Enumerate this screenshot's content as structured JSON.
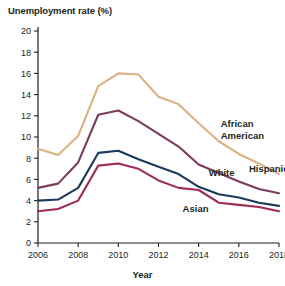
{
  "chart_data": {
    "type": "line",
    "title": "Unemployment rate (%)",
    "xlabel": "Year",
    "ylabel": "Unemployment rate (%)",
    "xlim": [
      2006,
      2018
    ],
    "ylim": [
      0,
      20
    ],
    "xticks": [
      2006,
      2008,
      2010,
      2012,
      2014,
      2016,
      2018
    ],
    "yticks": [
      0,
      2,
      4,
      6,
      8,
      10,
      12,
      14,
      16,
      18,
      20
    ],
    "grid": false,
    "legend_position": "inline-right",
    "x": [
      2006,
      2007,
      2008,
      2009,
      2010,
      2011,
      2012,
      2013,
      2014,
      2015,
      2016,
      2017,
      2018
    ],
    "series": [
      {
        "name": "African American",
        "color": "#dcb183",
        "values": [
          8.9,
          8.3,
          10.1,
          14.8,
          16.0,
          15.9,
          13.8,
          13.1,
          11.3,
          9.6,
          8.4,
          7.5,
          6.5
        ]
      },
      {
        "name": "Hispanic",
        "color": "#7b3a5e",
        "values": [
          5.2,
          5.6,
          7.6,
          12.1,
          12.5,
          11.5,
          10.3,
          9.1,
          7.4,
          6.6,
          5.8,
          5.1,
          4.7
        ]
      },
      {
        "name": "White",
        "color": "#1b3a5c",
        "values": [
          4.0,
          4.1,
          5.2,
          8.5,
          8.7,
          7.9,
          7.2,
          6.5,
          5.3,
          4.6,
          4.3,
          3.8,
          3.5
        ]
      },
      {
        "name": "Asian",
        "color": "#9e2b55",
        "values": [
          3.0,
          3.2,
          4.0,
          7.3,
          7.5,
          7.0,
          5.9,
          5.2,
          5.0,
          3.8,
          3.6,
          3.4,
          3.0
        ]
      }
    ],
    "annotations": [
      {
        "text": "African",
        "x": 2015.1,
        "y": 10.9
      },
      {
        "text": "American",
        "x": 2015.1,
        "y": 9.8
      },
      {
        "text": "Hispanic",
        "x": 2016.5,
        "y": 6.7
      },
      {
        "text": "White",
        "x": 2014.5,
        "y": 6.3
      },
      {
        "text": "Asian",
        "x": 2013.2,
        "y": 2.9
      }
    ]
  }
}
